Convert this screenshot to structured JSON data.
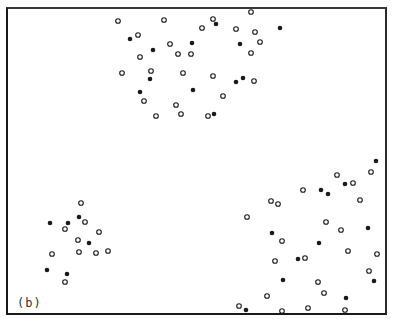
{
  "figure": {
    "panel_label": "(b)",
    "colors": {
      "ink": "#1a1a1a",
      "background": "#ffffff"
    },
    "marker_radius": 2.3
  },
  "chart_data": {
    "type": "scatter",
    "title": "",
    "xlabel": "",
    "ylabel": "",
    "grid": false,
    "legend": "none",
    "coordinate_space": "pixel (image coords, y down)",
    "series": [
      {
        "name": "open",
        "marker": "hollow-circle",
        "points": [
          [
            118,
            21
          ],
          [
            164,
            20
          ],
          [
            138,
            35
          ],
          [
            170,
            44
          ],
          [
            178,
            54
          ],
          [
            191,
            54
          ],
          [
            140,
            57
          ],
          [
            122,
            73
          ],
          [
            151,
            71
          ],
          [
            183,
            73
          ],
          [
            144,
            101
          ],
          [
            176,
            105
          ],
          [
            181,
            114
          ],
          [
            156,
            116
          ],
          [
            213,
            19
          ],
          [
            202,
            28
          ],
          [
            236,
            29
          ],
          [
            251,
            12
          ],
          [
            255,
            32
          ],
          [
            260,
            42
          ],
          [
            251,
            53
          ],
          [
            213,
            76
          ],
          [
            254,
            81
          ],
          [
            223,
            96
          ],
          [
            208,
            116
          ],
          [
            81,
            203
          ],
          [
            85,
            222
          ],
          [
            65,
            229
          ],
          [
            99,
            232
          ],
          [
            78,
            240
          ],
          [
            52,
            254
          ],
          [
            79,
            252
          ],
          [
            96,
            253
          ],
          [
            108,
            251
          ],
          [
            65,
            282
          ],
          [
            303,
            190
          ],
          [
            371,
            172
          ],
          [
            337,
            175
          ],
          [
            353,
            183
          ],
          [
            271,
            201
          ],
          [
            278,
            204
          ],
          [
            247,
            217
          ],
          [
            360,
            200
          ],
          [
            326,
            222
          ],
          [
            341,
            230
          ],
          [
            282,
            241
          ],
          [
            275,
            261
          ],
          [
            305,
            258
          ],
          [
            348,
            251
          ],
          [
            377,
            254
          ],
          [
            369,
            271
          ],
          [
            318,
            282
          ],
          [
            324,
            293
          ],
          [
            267,
            296
          ],
          [
            239,
            306
          ],
          [
            282,
            311
          ],
          [
            308,
            308
          ],
          [
            345,
            310
          ]
        ]
      },
      {
        "name": "filled",
        "marker": "solid-circle",
        "points": [
          [
            130,
            39
          ],
          [
            153,
            50
          ],
          [
            192,
            43
          ],
          [
            150,
            79
          ],
          [
            140,
            92
          ],
          [
            193,
            90
          ],
          [
            216,
            24
          ],
          [
            280,
            28
          ],
          [
            240,
            44
          ],
          [
            236,
            82
          ],
          [
            243,
            78
          ],
          [
            214,
            114
          ],
          [
            79,
            217
          ],
          [
            50,
            223
          ],
          [
            68,
            223
          ],
          [
            89,
            243
          ],
          [
            47,
            270
          ],
          [
            67,
            274
          ],
          [
            376,
            161
          ],
          [
            345,
            184
          ],
          [
            321,
            190
          ],
          [
            328,
            194
          ],
          [
            368,
            228
          ],
          [
            272,
            233
          ],
          [
            319,
            243
          ],
          [
            298,
            259
          ],
          [
            374,
            281
          ],
          [
            283,
            280
          ],
          [
            346,
            298
          ],
          [
            246,
            310
          ]
        ]
      }
    ]
  }
}
